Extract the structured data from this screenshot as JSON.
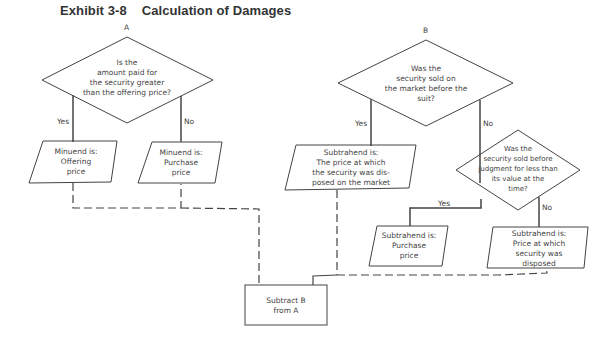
{
  "exhibit": {
    "number": "Exhibit 3-8",
    "title": "Calculation of Damages"
  },
  "branch_a": {
    "label": "A",
    "question": "Is the\namount paid for\nthe security greater\nthan the offering price?",
    "yes_label": "Yes",
    "no_label": "No",
    "yes_result": "Minuend is:\nOffering\nprice",
    "no_result": "Minuend is:\nPurchase\nprice"
  },
  "branch_b": {
    "label": "B",
    "question": "Was the\nsecurity sold on\nthe market before the\nsuit?",
    "yes_label": "Yes",
    "no_label": "No",
    "yes_result": "Subtrahend is:\nThe price at which\nthe security was dis-\nposed on the market",
    "sub_question": "Was the\nsecurity sold before\njudgment for less than\nits value at the\ntime?",
    "sub_yes_label": "Yes",
    "sub_no_label": "No",
    "sub_yes_result": "Subtrahend is:\nPurchase\nprice",
    "sub_no_result": "Subtrahend is:\nPrice at which\nsecurity was\ndisposed"
  },
  "final": {
    "result": "Subtract B\nfrom A"
  }
}
